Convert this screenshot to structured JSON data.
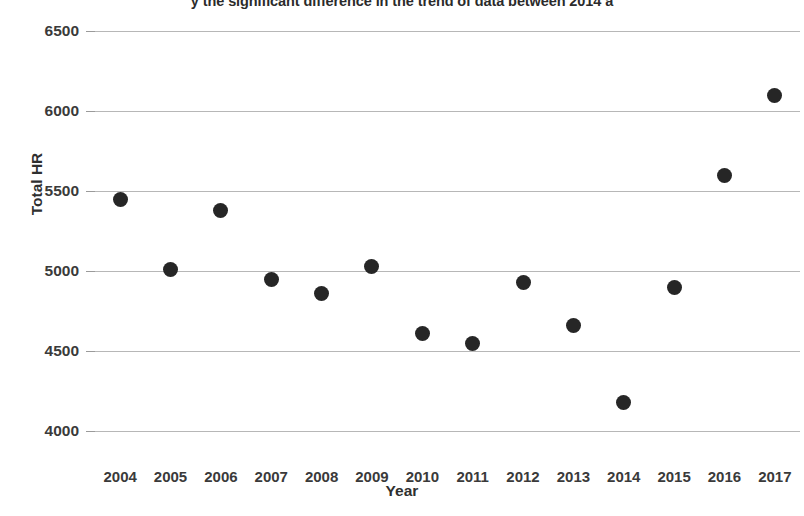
{
  "chart_data": {
    "type": "scatter",
    "title": "y the significant difference in the trend of data between 2014 a",
    "xlabel": "Year",
    "ylabel": "Total HR",
    "categories": [
      "2004",
      "2005",
      "2006",
      "2007",
      "2008",
      "2009",
      "2010",
      "2011",
      "2012",
      "2013",
      "2014",
      "2015",
      "2016",
      "2017"
    ],
    "x": [
      2004,
      2005,
      2006,
      2007,
      2008,
      2009,
      2010,
      2011,
      2012,
      2013,
      2014,
      2015,
      2016,
      2017
    ],
    "values": [
      5450,
      5010,
      5380,
      4950,
      4860,
      5030,
      4610,
      4550,
      4930,
      4660,
      4180,
      4900,
      5600,
      6100
    ],
    "series": [
      {
        "name": "Total HR",
        "values": [
          5450,
          5010,
          5380,
          4950,
          4860,
          5030,
          4610,
          4550,
          4930,
          4660,
          4180,
          4900,
          5600,
          6100
        ]
      }
    ],
    "ylim": [
      4000,
      6500
    ],
    "yticks": [
      4000,
      4500,
      5000,
      5500,
      6000,
      6500
    ],
    "ytick_labels": [
      "4000",
      "4500",
      "5000",
      "5500",
      "6000",
      "6500"
    ],
    "xlim": [
      2003.5,
      2017.5
    ],
    "grid": "horizontal",
    "legend": "none",
    "marker_color": "#262626",
    "gridline_color": "#b7b7b7",
    "marker_size": 15
  }
}
